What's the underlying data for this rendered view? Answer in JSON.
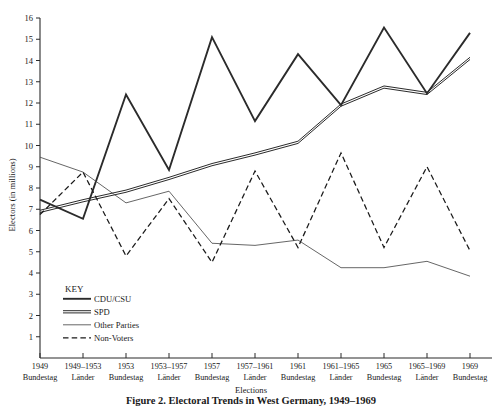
{
  "chart_data": {
    "type": "line",
    "title": "",
    "xlabel": "Elections",
    "ylabel": "Electors (in millions)",
    "ylim": [
      0,
      16
    ],
    "yticks": [
      1,
      2,
      3,
      4,
      5,
      6,
      7,
      8,
      9,
      10,
      11,
      12,
      13,
      14,
      15,
      16
    ],
    "grid": false,
    "legend_position": "inside-lower-left",
    "legend_title": "KEY",
    "categories": [
      "1949 Bundestag",
      "1949-1953 Länder",
      "1953 Bundestag",
      "1953-1957 Länder",
      "1957 Bundestag",
      "1957-1961 Länder",
      "1961 Bundestag",
      "1961-1965 Länder",
      "1965 Bundestag",
      "1965-1969 Länder",
      "1969 Bundestag"
    ],
    "x_tick_years": [
      "1949",
      "1949–1953",
      "1953",
      "1953–1957",
      "1957",
      "1957–1961",
      "1961",
      "1961–1965",
      "1965",
      "1965–1969",
      "1969"
    ],
    "x_tick_bodies": [
      "Bundestag",
      "Länder",
      "Bundestag",
      "Länder",
      "Bundestag",
      "Länder",
      "Bundestag",
      "Länder",
      "Bundestag",
      "Länder",
      "Bundestag"
    ],
    "series": [
      {
        "name": "CDU/CSU",
        "style": "thick-solid",
        "color": "#2b2b2b",
        "values": [
          7.45,
          6.55,
          12.4,
          8.85,
          15.1,
          11.15,
          14.3,
          11.9,
          15.55,
          12.45,
          15.3
        ]
      },
      {
        "name": "SPD",
        "style": "double-solid",
        "color": "#2b2b2b",
        "values": [
          6.9,
          7.4,
          7.85,
          8.45,
          9.1,
          9.6,
          10.15,
          11.9,
          12.75,
          12.45,
          14.1
        ]
      },
      {
        "name": "Other Parties",
        "style": "thin-solid",
        "color": "#4a4a4a",
        "values": [
          9.45,
          8.75,
          7.3,
          7.85,
          5.4,
          5.3,
          5.55,
          4.25,
          4.25,
          4.55,
          3.85
        ]
      },
      {
        "name": "Non-Voters",
        "style": "dashed",
        "color": "#1a1a1a",
        "values": [
          6.75,
          8.75,
          4.8,
          7.5,
          4.5,
          8.8,
          5.2,
          9.65,
          5.2,
          9.0,
          5.05
        ]
      }
    ]
  },
  "legend": {
    "title": "KEY",
    "entries": [
      {
        "label": "CDU/CSU",
        "style": "thick-solid"
      },
      {
        "label": "SPD",
        "style": "double-solid"
      },
      {
        "label": "Other Parties",
        "style": "thin-solid"
      },
      {
        "label": "Non-Voters",
        "style": "dashed"
      }
    ]
  },
  "axes": {
    "y_title": "Electors (in millions)",
    "x_title": "Elections"
  },
  "caption": {
    "text": "Figure 2. Electoral Trends in West Germany, 1949–1969"
  }
}
